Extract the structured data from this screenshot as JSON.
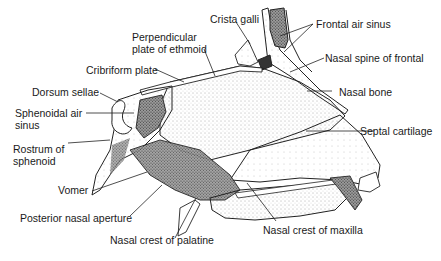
{
  "diagram": {
    "labels": {
      "crista_galli": "Crista galli",
      "frontal_air_sinus": "Frontal air sinus",
      "perpendicular_plate_line1": "Perpendicular",
      "perpendicular_plate_line2": "plate of ethmoid",
      "nasal_spine_of_frontal": "Nasal spine of frontal",
      "cribriform_plate": "Cribriform plate",
      "nasal_bone": "Nasal bone",
      "dorsum_sellae": "Dorsum sellae",
      "sphenoidal_air_sinus_line1": "Sphenoidal air",
      "sphenoidal_air_sinus_line2": "sinus",
      "septal_cartilage": "Septal cartilage",
      "rostrum_line1": "Rostrum of",
      "rostrum_line2": "sphenoid",
      "vomer": "Vomer",
      "posterior_nasal_aperture": "Posterior nasal aperture",
      "nasal_crest_of_maxilla": "Nasal crest of maxilla",
      "nasal_crest_of_palatine": "Nasal crest of palatine"
    }
  }
}
